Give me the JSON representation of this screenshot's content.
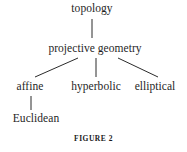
{
  "figure": {
    "caption": "FIGURE 2",
    "background_color": "#ffffff",
    "line_color": "#2b2b2b",
    "text_color": "#1f1f1f"
  },
  "diagram": {
    "type": "tree",
    "orientation": "top-down",
    "levels": 4,
    "nodes": {
      "topology": "topology",
      "projective_geometry": "projective geometry",
      "affine": "affine",
      "hyperbolic": "hyperbolic",
      "elliptical": "elliptical",
      "euclidean": "Euclidean"
    },
    "edges": [
      {
        "from": "topology",
        "to": "projective geometry",
        "style": "vertical"
      },
      {
        "from": "projective geometry",
        "to": "affine",
        "style": "diagonal-left"
      },
      {
        "from": "projective geometry",
        "to": "hyperbolic",
        "style": "vertical"
      },
      {
        "from": "projective geometry",
        "to": "elliptical",
        "style": "diagonal-right"
      },
      {
        "from": "affine",
        "to": "Euclidean",
        "style": "vertical"
      }
    ]
  }
}
